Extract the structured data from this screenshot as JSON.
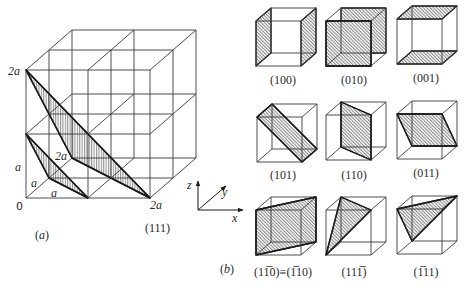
{
  "figure": {
    "panel_a": {
      "caption": "(a)",
      "plane_label": "(111)",
      "intercepts": {
        "z_top": "2a",
        "z_mid": "a",
        "y_near": "a",
        "x_near": "a",
        "y_far": "2a",
        "origin": "0",
        "x_far": "2a"
      },
      "axes": {
        "x": "x",
        "y": "y",
        "z": "z"
      }
    },
    "panel_b": {
      "caption": "(b)",
      "cubes": [
        {
          "label": "(100)"
        },
        {
          "label": "(010)"
        },
        {
          "label": "(001)"
        },
        {
          "label": "(101)"
        },
        {
          "label": "(110)"
        },
        {
          "label": "(011)"
        },
        {
          "label": "(11̅0)≡(1̅10)"
        },
        {
          "label": "(111̅)"
        },
        {
          "label": "(1̅11)"
        }
      ]
    },
    "colors": {
      "line": "#3a3a3a",
      "hatch": "#555555",
      "background": "#ffffff"
    }
  }
}
